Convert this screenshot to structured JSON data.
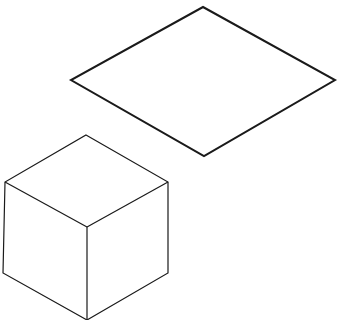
{
  "diagram": {
    "background": "#ffffff",
    "stroke_color": "#1a1a1a",
    "shapes": [
      {
        "name": "rhombus",
        "kind": "isometric-square",
        "stroke_width": 2,
        "points": [
          [
            203,
            7
          ],
          [
            335,
            80
          ],
          [
            204,
            156
          ],
          [
            71,
            80
          ]
        ]
      },
      {
        "name": "cube",
        "kind": "isometric-cube",
        "stroke_width": 1.2,
        "outline": [
          [
            86,
            135
          ],
          [
            168,
            182
          ],
          [
            168,
            273
          ],
          [
            87,
            320
          ],
          [
            3,
            273
          ],
          [
            5,
            182
          ]
        ],
        "inner_edges": [
          [
            [
              5,
              182
            ],
            [
              87,
              227
            ]
          ],
          [
            [
              168,
              182
            ],
            [
              87,
              227
            ]
          ],
          [
            [
              87,
              227
            ],
            [
              87,
              320
            ]
          ]
        ]
      }
    ]
  }
}
